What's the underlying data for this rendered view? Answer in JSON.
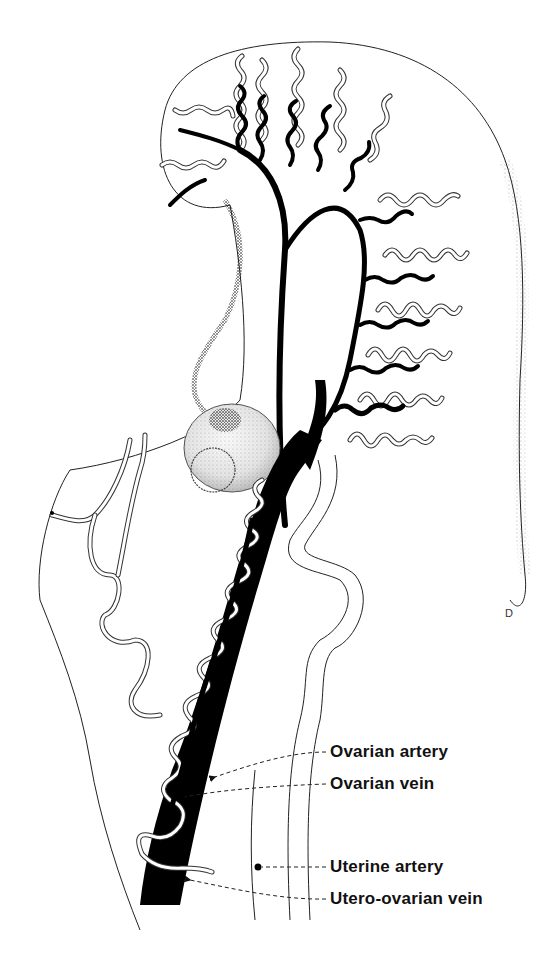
{
  "figure": {
    "signature": "D",
    "structures": [
      "ovary",
      "uterine tube",
      "mesovarium",
      "ovarian artery",
      "ovarian vein",
      "uterine artery",
      "utero-ovarian vein"
    ]
  },
  "labels": [
    {
      "id": "ovarian-artery",
      "text": "Ovarian artery"
    },
    {
      "id": "ovarian-vein",
      "text": "Ovarian vein"
    },
    {
      "id": "uterine-artery",
      "text": "Uterine artery"
    },
    {
      "id": "utero-ovarian-vein",
      "text": "Utero-ovarian vein"
    }
  ],
  "colors": {
    "ink": "#000000",
    "paper": "#ffffff",
    "stipple": "#555555"
  }
}
